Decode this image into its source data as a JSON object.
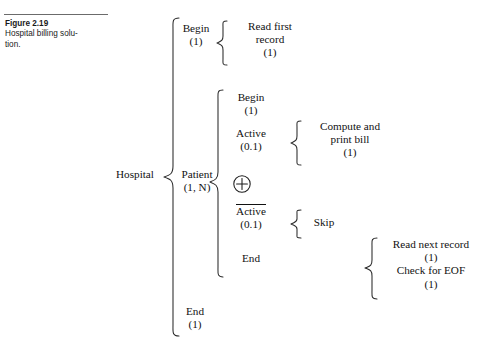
{
  "figure": {
    "number": "Figure 2.19",
    "caption_line1": "Hospital billing solu-",
    "caption_line2": "tion."
  },
  "diagram": {
    "root": {
      "label": "Hospital"
    },
    "level1": [
      {
        "name": "begin",
        "label": "Begin",
        "count": "(1)"
      },
      {
        "name": "patient",
        "label": "Patient",
        "count": "(1, N)"
      },
      {
        "name": "end",
        "label": "End",
        "count": "(1)"
      }
    ],
    "begin_children": [
      {
        "name": "read-first-record",
        "line1": "Read first",
        "line2": "record",
        "count": "(1)"
      }
    ],
    "patient_children": [
      {
        "name": "patient-begin",
        "label": "Begin",
        "count": "(1)"
      },
      {
        "name": "patient-active",
        "label": "Active",
        "count": "(0.1)",
        "overline": false
      },
      {
        "name": "oplus",
        "label": "⊕"
      },
      {
        "name": "patient-not-active",
        "label": "Active",
        "count": "(0.1)",
        "overline": true
      },
      {
        "name": "patient-end",
        "label": "End",
        "count": ""
      }
    ],
    "active_children": [
      {
        "name": "compute-print-bill",
        "line1": "Compute and",
        "line2": "print bill",
        "count": "(1)"
      }
    ],
    "not_active_children": [
      {
        "name": "skip",
        "label": "Skip",
        "count": ""
      }
    ],
    "end_children": [
      {
        "name": "read-next-record",
        "line1": "Read next record",
        "count1": "(1)",
        "line2": "Check for EOF",
        "count2": "(1)"
      }
    ]
  },
  "colors": {
    "ink": "#111111",
    "rule": "#6b6b6b",
    "background": "#ffffff"
  }
}
